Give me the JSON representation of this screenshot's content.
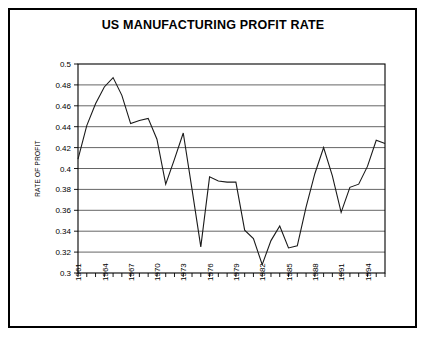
{
  "chart_data": {
    "type": "line",
    "title": "US MANUFACTURING PROFIT RATE",
    "xlabel": "",
    "ylabel": "RATE OF PROFIT",
    "xlim": [
      1961,
      1996
    ],
    "ylim": [
      0.3,
      0.5
    ],
    "yticks": [
      0.3,
      0.32,
      0.34,
      0.36,
      0.38,
      0.4,
      0.42,
      0.44,
      0.46,
      0.48,
      0.5
    ],
    "ytick_labels": [
      "0.3",
      "0.32",
      "0.34",
      "0.36",
      "0.38",
      "0.4",
      "0.42",
      "0.44",
      "0.46",
      "0.48",
      "0.5"
    ],
    "xticks": [
      1961,
      1964,
      1967,
      1970,
      1973,
      1976,
      1979,
      1982,
      1985,
      1988,
      1991,
      1994
    ],
    "xtick_labels": [
      "1961",
      "1964",
      "1967",
      "1970",
      "1973",
      "1976",
      "1979",
      "1982",
      "1985",
      "1988",
      "1991",
      "1994"
    ],
    "grid": "horizontal",
    "legend": "none",
    "series": [
      {
        "name": "Rate of profit",
        "color": "#1a1a1a",
        "x": [
          1961,
          1962,
          1963,
          1964,
          1965,
          1966,
          1967,
          1968,
          1969,
          1970,
          1971,
          1972,
          1973,
          1974,
          1975,
          1976,
          1977,
          1978,
          1979,
          1980,
          1981,
          1982,
          1983,
          1984,
          1985,
          1986,
          1987,
          1988,
          1989,
          1990,
          1991,
          1992,
          1993,
          1994,
          1995,
          1996
        ],
        "values": [
          0.409,
          0.441,
          0.462,
          0.478,
          0.487,
          0.47,
          0.443,
          0.446,
          0.448,
          0.428,
          0.385,
          0.409,
          0.434,
          0.38,
          0.325,
          0.392,
          0.388,
          0.387,
          0.387,
          0.341,
          0.333,
          0.308,
          0.331,
          0.345,
          0.324,
          0.326,
          0.363,
          0.395,
          0.42,
          0.393,
          0.358,
          0.382,
          0.385,
          0.402,
          0.427,
          0.424
        ]
      }
    ]
  }
}
